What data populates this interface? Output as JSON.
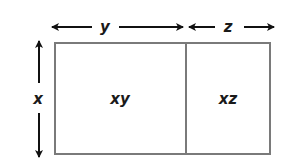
{
  "diagram": {
    "dimension_labels": {
      "top_left": "y",
      "top_right": "z",
      "side": "x"
    },
    "regions": [
      {
        "label": "xy"
      },
      {
        "label": "xz"
      }
    ],
    "colors": {
      "outline": "#7a7a7a",
      "arrows": "#111111",
      "text": "#1a1a1a"
    }
  }
}
